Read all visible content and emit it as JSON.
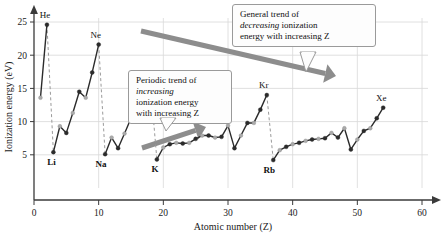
{
  "figure": {
    "background": "#ffffff",
    "axis_color": "#3a3a3a",
    "grid_color": "#d8d8d8",
    "series_color_dark": "#2b2b2b",
    "series_color_light": "#aaaaaa",
    "arrow_color": "#8d8d8d",
    "dashed_color": "#9a9a9a"
  },
  "axes": {
    "x": {
      "label": "Atomic number (Z)",
      "ticks": [
        0,
        10,
        20,
        30,
        40,
        50,
        60
      ],
      "tick_labels": [
        "0",
        "10",
        "20",
        "30",
        "40",
        "50",
        "60"
      ],
      "min": 0,
      "max": 62
    },
    "y": {
      "label": "Ionization energy (eV)",
      "ticks": [
        5,
        10,
        15,
        20,
        25
      ],
      "tick_labels": [
        "5",
        "10",
        "15",
        "20",
        "25"
      ],
      "min": 0,
      "max": 26.5
    }
  },
  "callouts": {
    "general": {
      "line1": "General trend of",
      "line2_em": "decreasing",
      "line2_rest": " ionization",
      "line3": "energy with increasing Z"
    },
    "periodic": {
      "line1": "Periodic trend of",
      "line2_em": "increasing",
      "line3": "ionization energy",
      "line4": "with increasing Z"
    }
  },
  "point_labels": [
    {
      "name": "He",
      "z": 2,
      "ie": 24.6,
      "bold": false,
      "dx": -2,
      "dy": -7
    },
    {
      "name": "Li",
      "z": 3,
      "ie": 5.4,
      "bold": true,
      "dx": -2,
      "dy": 13
    },
    {
      "name": "Ne",
      "z": 10,
      "ie": 21.6,
      "bold": false,
      "dx": -3,
      "dy": -7
    },
    {
      "name": "Na",
      "z": 11,
      "ie": 5.1,
      "bold": true,
      "dx": -4,
      "dy": 13
    },
    {
      "name": "Ar",
      "z": 18,
      "ie": 15.8,
      "bold": false,
      "dx": -9,
      "dy": -7
    },
    {
      "name": "K",
      "z": 19,
      "ie": 4.3,
      "bold": true,
      "dx": -2,
      "dy": 13
    },
    {
      "name": "Kr",
      "z": 36,
      "ie": 14.0,
      "bold": false,
      "dx": -3,
      "dy": -7
    },
    {
      "name": "Rb",
      "z": 37,
      "ie": 4.2,
      "bold": true,
      "dx": -4,
      "dy": 13
    },
    {
      "name": "Xe",
      "z": 54,
      "ie": 12.1,
      "bold": false,
      "dx": -2,
      "dy": -7
    }
  ],
  "dashed_drops": [
    {
      "z": 2,
      "from": 24.6,
      "to": 5.4
    },
    {
      "z": 10,
      "from": 21.6,
      "to": 5.1
    },
    {
      "z": 18,
      "from": 15.8,
      "to": 4.3
    },
    {
      "z": 36,
      "from": 14.0,
      "to": 4.2
    }
  ],
  "arrows": {
    "general_trend": {
      "x1": 141,
      "y1": 31,
      "x2": 336,
      "y2": 76,
      "width": 5
    },
    "periodic_trend": {
      "x1": 142,
      "y1": 148,
      "x2": 206,
      "y2": 127,
      "width": 5
    }
  },
  "chart_data": {
    "type": "line",
    "title": "",
    "xlabel": "Atomic number (Z)",
    "ylabel": "Ionization energy (eV)",
    "xlim": [
      0,
      62
    ],
    "ylim": [
      0,
      26.5
    ],
    "grid": true,
    "legend": "none",
    "marker_scheme": "noble gases and alkali metals dark; other elements alternate light gray / dark gray",
    "x": [
      1,
      2,
      3,
      4,
      5,
      6,
      7,
      8,
      9,
      10,
      11,
      12,
      13,
      14,
      15,
      16,
      17,
      18,
      19,
      20,
      21,
      22,
      23,
      24,
      25,
      26,
      27,
      28,
      29,
      30,
      31,
      32,
      33,
      34,
      35,
      36,
      37,
      38,
      39,
      40,
      41,
      42,
      43,
      44,
      45,
      46,
      47,
      48,
      49,
      50,
      51,
      52,
      53,
      54
    ],
    "series": [
      {
        "name": "First ionization energy (eV)",
        "values": [
          13.6,
          24.6,
          5.4,
          9.3,
          8.3,
          11.3,
          14.5,
          13.6,
          17.4,
          21.6,
          5.1,
          7.6,
          6.0,
          8.2,
          10.5,
          10.4,
          13.0,
          15.8,
          4.3,
          6.1,
          6.6,
          6.8,
          6.7,
          6.8,
          7.4,
          7.9,
          7.9,
          7.6,
          7.7,
          9.4,
          6.0,
          7.9,
          9.8,
          9.8,
          11.8,
          14.0,
          4.2,
          5.7,
          6.2,
          6.6,
          6.8,
          7.1,
          7.3,
          7.4,
          7.5,
          8.3,
          7.6,
          9.0,
          5.8,
          7.3,
          8.6,
          9.0,
          10.5,
          12.1
        ]
      }
    ],
    "marker_kinds": [
      "light",
      "dark",
      "dark",
      "light",
      "dark",
      "light",
      "dark",
      "light",
      "dark",
      "dark",
      "dark",
      "light",
      "dark",
      "light",
      "dark",
      "light",
      "dark",
      "dark",
      "dark",
      "light",
      "dark",
      "light",
      "dark",
      "light",
      "dark",
      "light",
      "dark",
      "light",
      "dark",
      "light",
      "dark",
      "light",
      "dark",
      "light",
      "dark",
      "dark",
      "dark",
      "light",
      "dark",
      "light",
      "dark",
      "light",
      "dark",
      "light",
      "dark",
      "light",
      "dark",
      "light",
      "dark",
      "light",
      "dark",
      "light",
      "dark",
      "dark"
    ],
    "annotations": [
      "General trend of decreasing ionization energy with increasing Z",
      "Periodic trend of increasing ionization energy with increasing Z"
    ]
  }
}
